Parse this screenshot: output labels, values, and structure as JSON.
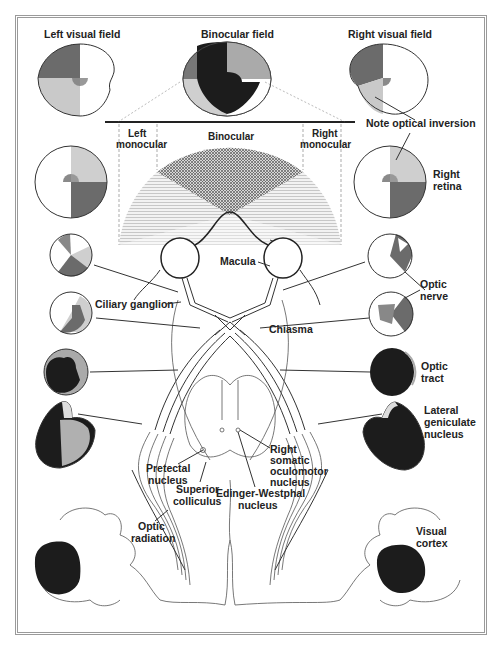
{
  "colors": {
    "q_upper_left": "#6b6b6b",
    "q_lower_left": "#c9c9c9",
    "q_upper_right": "#a8a8a8",
    "q_lower_right": "#ffffff",
    "macula": "#8a8a8a",
    "binocular_dark": "#1c1c1c",
    "border": "#9a9a9a"
  },
  "fields": {
    "left": "Left visual field",
    "binocular": "Binocular field",
    "right": "Right visual field"
  },
  "field_zones": {
    "left_monocular": [
      "Left",
      "monocular"
    ],
    "binocular": "Binocular",
    "right_monocular": [
      "Right",
      "monocular"
    ]
  },
  "labels": {
    "note": "Note optical inversion",
    "right_retina": [
      "Right",
      "retina"
    ],
    "macula": "Macula",
    "ciliary_ganglion": "Ciliary ganglion",
    "optic_nerve": [
      "Optic",
      "nerve"
    ],
    "chiasma": "Chiasma",
    "optic_tract": [
      "Optic",
      "tract"
    ],
    "lgn": [
      "Lateral",
      "geniculate",
      "nucleus"
    ],
    "pretectal": [
      "Pretectal",
      "nucleus"
    ],
    "right_somatic": [
      "Right",
      "somatic",
      "oculomotor",
      "nucleus"
    ],
    "superior_colliculus": [
      "Superior",
      "colliculus"
    ],
    "edinger": [
      "Edinger-Westphal",
      "nucleus"
    ],
    "optic_radiation": [
      "Optic",
      "radiation"
    ],
    "visual_cortex": [
      "Visual",
      "cortex"
    ]
  }
}
